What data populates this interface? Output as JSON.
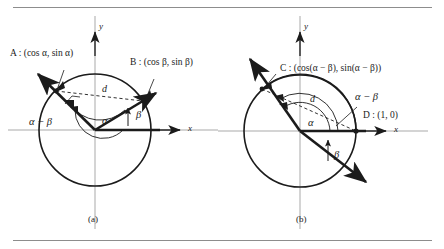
{
  "figure": {
    "background": "#ffffff",
    "line_color": "#1b1b1b",
    "axis_color": "#9a9a9a",
    "rule_color": "#8d8d8d"
  },
  "panel_a": {
    "caption": "(a)",
    "axis_x": "x",
    "axis_y": "y",
    "point_a": "A : (cos α, sin α)",
    "point_b": "B : (cos β, sin β)",
    "chord": "d",
    "angle_alpha": "α",
    "angle_beta": "β",
    "angle_diff": "α − β"
  },
  "panel_b": {
    "caption": "(b)",
    "axis_x": "x",
    "axis_y": "y",
    "point_c": "C : (cos(α − β), sin(α − β))",
    "point_d": "D : (1, 0)",
    "chord": "d",
    "angle_alpha": "α",
    "angle_beta": "β",
    "angle_diff": "α − β"
  }
}
